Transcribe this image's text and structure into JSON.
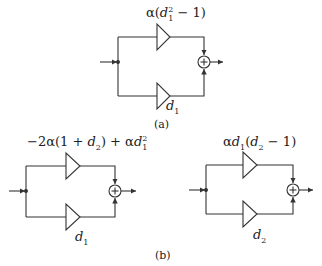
{
  "figure": {
    "panels": [
      {
        "id": "a",
        "caption": "(a)",
        "input_arrow": true,
        "branches": [
          {
            "position": "top",
            "gain_label": "α(d₁² − 1)",
            "parts": {
              "pre": "α(",
              "var": "d",
              "sub": "1",
              "sup": "2",
              "post": " − 1)"
            }
          },
          {
            "position": "bottom",
            "gain_label": "d₁",
            "parts": {
              "var": "d",
              "sub": "1"
            }
          }
        ],
        "summing_node": "+",
        "output_arrow": true
      },
      {
        "id": "b-left",
        "caption": "(b)",
        "input_arrow": true,
        "branches": [
          {
            "position": "top",
            "gain_label": "−2α(1 + d₂) + αd₁²",
            "parts": {
              "pre": "−2α(1 + ",
              "var": "d",
              "sub": "2",
              "mid": ") + α",
              "var2": "d",
              "sub2": "1",
              "sup2": "2"
            }
          },
          {
            "position": "bottom",
            "gain_label": "d₁",
            "parts": {
              "var": "d",
              "sub": "1"
            }
          }
        ],
        "summing_node": "+",
        "output_arrow": true
      },
      {
        "id": "b-right",
        "input_arrow": true,
        "branches": [
          {
            "position": "top",
            "gain_label": "αd₁(d₂ − 1)",
            "parts": {
              "pre": "α",
              "var": "d",
              "sub": "1",
              "mid": "(",
              "var2": "d",
              "sub2": "2",
              "post": " − 1)"
            }
          },
          {
            "position": "bottom",
            "gain_label": "d₂",
            "parts": {
              "var": "d",
              "sub": "2"
            }
          }
        ],
        "summing_node": "+",
        "output_arrow": true
      }
    ],
    "colors": {
      "stroke": "#333333",
      "background": "#ffffff"
    }
  }
}
